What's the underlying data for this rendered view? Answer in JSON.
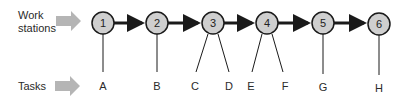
{
  "labels": {
    "workstations_line1": "Work",
    "workstations_line2": "stations",
    "tasks": "Tasks"
  },
  "colors": {
    "node_fill": "#cfcfcf",
    "node_stroke": "#1a1a1a",
    "pointer_arrow": "#b5b5b5",
    "flow_arrow": "#1a1a1a"
  },
  "stations": [
    {
      "id": "1",
      "tasks": [
        "A"
      ]
    },
    {
      "id": "2",
      "tasks": [
        "B"
      ]
    },
    {
      "id": "3",
      "tasks": [
        "C",
        "D"
      ]
    },
    {
      "id": "4",
      "tasks": [
        "E",
        "F"
      ]
    },
    {
      "id": "5",
      "tasks": [
        "G"
      ]
    },
    {
      "id": "6",
      "tasks": [
        "H"
      ]
    }
  ]
}
